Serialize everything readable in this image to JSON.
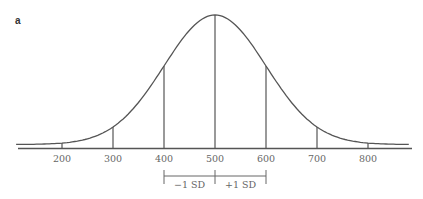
{
  "panel": {
    "label": "a"
  },
  "chart_data": {
    "type": "line",
    "title": "",
    "subtitle": "Normal distribution curve",
    "xlabel": "",
    "ylabel": "",
    "mean": 500,
    "sd": 100,
    "x_ticks": [
      200,
      300,
      400,
      500,
      600,
      700,
      800
    ],
    "tick_labels": [
      "200",
      "300",
      "400",
      "500",
      "600",
      "700",
      "800"
    ],
    "xlim": [
      140,
      890
    ],
    "grid": false,
    "legend": null,
    "annotations": [
      {
        "text": "−1 SD",
        "from": 400,
        "to": 500
      },
      {
        "text": "+1 SD",
        "from": 500,
        "to": 600
      }
    ],
    "colors": {
      "line": "#555555",
      "text": "#666666"
    }
  }
}
